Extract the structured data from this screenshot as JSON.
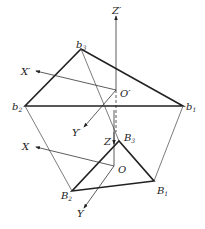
{
  "diagram": {
    "title": "",
    "labels": {
      "Zp": "Z′",
      "Xp": "X′",
      "Yp": "Y′",
      "Op": "O′",
      "b1": "b",
      "b1_sub": "1",
      "b2": "b",
      "b2_sub": "2",
      "b3": "b",
      "b3_sub": "3",
      "Z": "Z",
      "X": "X",
      "Y": "Y",
      "O": "O",
      "B1": "B",
      "B1_sub": "1",
      "B2": "B",
      "B2_sub": "2",
      "B3": "B",
      "B3_sub": "3"
    },
    "points": {
      "Op": [
        116,
        90
      ],
      "b1": [
        183,
        106
      ],
      "b2": [
        25,
        106
      ],
      "b3": [
        81,
        49
      ],
      "O": [
        114,
        166
      ],
      "B1": [
        154,
        181
      ],
      "B2": [
        72,
        191
      ],
      "B3": [
        119,
        141
      ]
    },
    "colors": {
      "line": "#222222",
      "thin": "#444444"
    }
  }
}
